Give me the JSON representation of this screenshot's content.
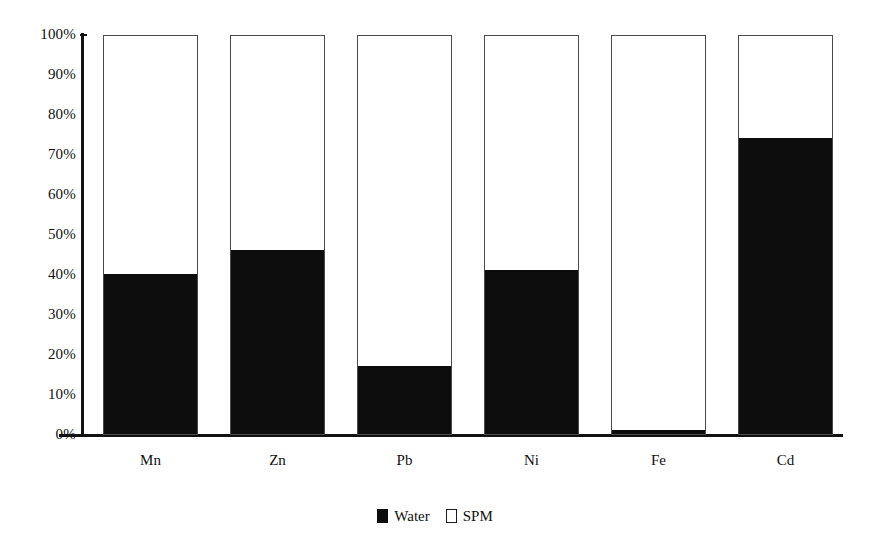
{
  "chart_data": {
    "type": "bar",
    "subtype": "stacked-100-percent",
    "title": "",
    "subtitle": "",
    "xlabel": "",
    "ylabel": "",
    "categories": [
      "Mn",
      "Zn",
      "Pb",
      "Ni",
      "Fe",
      "Cd"
    ],
    "series": [
      {
        "name": "Water",
        "color": "#0d0d0d",
        "values": [
          40,
          46,
          17,
          41,
          1,
          74
        ]
      },
      {
        "name": "SPM",
        "color": "#ffffff",
        "values": [
          60,
          54,
          83,
          59,
          99,
          26
        ]
      }
    ],
    "ylim": [
      0,
      100
    ],
    "y_ticks": [
      0,
      10,
      20,
      30,
      40,
      50,
      60,
      70,
      80,
      90,
      100
    ],
    "y_tick_labels": [
      "0%",
      "10%",
      "20%",
      "30%",
      "40%",
      "50%",
      "60%",
      "70%",
      "80%",
      "90%",
      "100%"
    ],
    "grid": false,
    "legend_position": "bottom-center",
    "legend_entries": [
      "Water",
      "SPM"
    ],
    "annotations": []
  },
  "axis": {
    "y_tick_labels": [
      "100%",
      "90%",
      "80%",
      "70%",
      "60%",
      "50%",
      "40%",
      "30%",
      "20%",
      "10%",
      "0%"
    ],
    "x_tick_labels": [
      "Mn",
      "Zn",
      "Pb",
      "Ni",
      "Fe",
      "Cd"
    ]
  },
  "legend": {
    "water_label": "Water",
    "spm_label": "SPM"
  },
  "colors": {
    "water": "#0d0d0d",
    "spm": "#ffffff",
    "axis": "#111111",
    "bar_outline": "#4a4a4a",
    "background": "#ffffff"
  }
}
